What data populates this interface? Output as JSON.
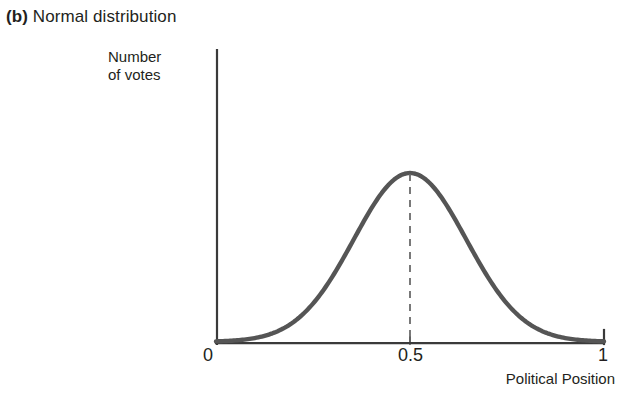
{
  "figure": {
    "panel_letter": "(b)",
    "caption": "Normal distribution"
  },
  "axes": {
    "y_label_line1": "Number",
    "y_label_line2": "of votes",
    "x_label": "Political Position",
    "x_ticks": [
      "0",
      "0.5",
      "1"
    ]
  },
  "colors": {
    "curve": "#555555",
    "axis": "#3a3a3a",
    "dashed_line": "#6b6b6b",
    "text": "#231f20",
    "background": "#ffffff"
  },
  "chart_data": {
    "type": "line",
    "title": "(b) Normal distribution",
    "xlabel": "Political Position",
    "ylabel": "Number of votes",
    "xlim": [
      0,
      1
    ],
    "ylim": [
      0,
      1
    ],
    "grid": false,
    "legend": null,
    "distribution": {
      "kind": "normal",
      "mean": 0.5,
      "std_dev": 0.145,
      "peak_x": 0.5,
      "peak_y": 1.0
    },
    "annotations": [
      {
        "type": "vertical-dashed-line",
        "x": 0.5,
        "from_y": 0,
        "to_y": 1.0,
        "label": "0.5"
      }
    ],
    "x": [
      0,
      0.05,
      0.1,
      0.15,
      0.2,
      0.25,
      0.3,
      0.35,
      0.4,
      0.45,
      0.5,
      0.55,
      0.6,
      0.65,
      0.7,
      0.75,
      0.8,
      0.85,
      0.9,
      0.95,
      1
    ],
    "y": [
      0.005,
      0.013,
      0.031,
      0.068,
      0.135,
      0.243,
      0.395,
      0.58,
      0.772,
      0.927,
      1.0,
      0.927,
      0.772,
      0.58,
      0.395,
      0.243,
      0.135,
      0.068,
      0.031,
      0.013,
      0.005
    ]
  }
}
